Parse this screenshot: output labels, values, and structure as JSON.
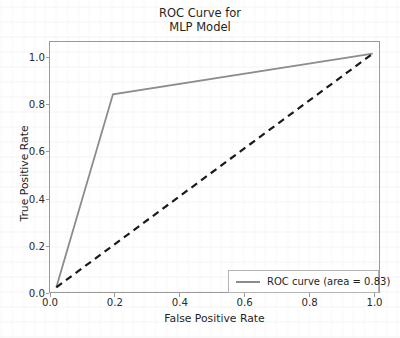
{
  "chart_data": {
    "type": "line",
    "title": "ROC Curve for\nMLP Model",
    "xlabel": "False Positive Rate",
    "ylabel": "True Positive Rate",
    "xlim": [
      -0.02,
      1.02
    ],
    "ylim": [
      -0.02,
      1.05
    ],
    "xticks": [
      "0.0",
      "0.2",
      "0.4",
      "0.6",
      "0.8",
      "1.0"
    ],
    "xtick_values": [
      0.0,
      0.2,
      0.4,
      0.6,
      0.8,
      1.0
    ],
    "yticks": [
      "0.0",
      "0.2",
      "0.4",
      "0.6",
      "0.8",
      "1.0"
    ],
    "ytick_values": [
      0.0,
      0.2,
      0.4,
      0.6,
      0.8,
      1.0
    ],
    "grid": false,
    "legend_position": "lower right",
    "series": [
      {
        "name": "ROC curve (area = 0.83)",
        "legend_label": "ROC curve (area = 0.83)",
        "style": "solid",
        "color": "#8c8c8c",
        "linewidth": 1.8,
        "x": [
          0.0,
          0.179,
          1.0
        ],
        "y": [
          0.0,
          0.826,
          1.0
        ],
        "in_legend": true
      },
      {
        "name": "chance-diagonal",
        "legend_label": "",
        "style": "dashed",
        "color": "#1a1a1a",
        "linewidth": 2.2,
        "x": [
          0.0,
          1.0
        ],
        "y": [
          0.0,
          1.0
        ],
        "in_legend": false
      }
    ],
    "auc": 0.83
  },
  "figure": {
    "title_line1": "ROC Curve for",
    "title_line2": "MLP Model",
    "axis_color": "#9a9a9a"
  },
  "legend": {
    "entries": [
      {
        "label": "ROC curve (area = 0.83)",
        "swatch_color": "#8c8c8c"
      }
    ]
  }
}
